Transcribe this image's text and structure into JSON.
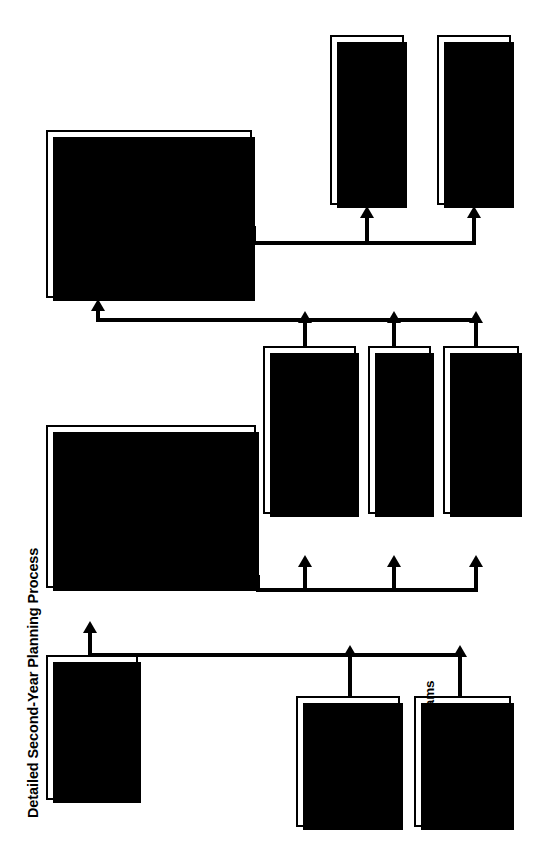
{
  "title": "Detailed Second-Year Planning Process",
  "nodes": {
    "resource_allocation": {
      "title": "Resource Allocation",
      "subtitle": "Meeting:",
      "bullets": [
        "Pick and fund priority issue action plans.",
        "Pick teams.",
        "Approve final depart-mental plans and funding.",
        "Review personnel ABCDs and take action.",
        "Update short-term and strategic objectives."
      ]
    },
    "priority_setting": {
      "title": "Priority-Setting",
      "subtitle": "Meeting:",
      "bullets": [
        "Review changes in internal/external world.",
        "Review implementation process.",
        "Review progress on direction statement actionable issues.",
        "Review departmental plans and give direction.",
        "Develop priority issues."
      ]
    },
    "top_team": {
      "title": "Top Team",
      "body": "Update environmental and market analysis."
    },
    "departments_plans": {
      "title": "Departments",
      "body": "Complete departmental plans:",
      "sub_bullets": [
        "Operating",
        "Strategic"
      ]
    },
    "program_teams": {
      "title": "Program Teams",
      "body": "Complete draft program plans."
    },
    "individuals": {
      "title": "Individuals",
      "body": "Define their part of departmental plan. Start on individual objectives."
    },
    "departments_conduct": {
      "title": "Departments",
      "body": "Conduct departmental planning and dip-down."
    },
    "implementation_teams": {
      "title": "Implementation Teams",
      "body": "Prepare update on implementation processes."
    },
    "budget": {
      "title": "Budget"
    },
    "scorecards": {
      "title": "Scorecards",
      "body": "Final top-team, departmental, and individual scorecards"
    }
  },
  "colors": {
    "ink": "#000000",
    "paper": "#ffffff"
  }
}
